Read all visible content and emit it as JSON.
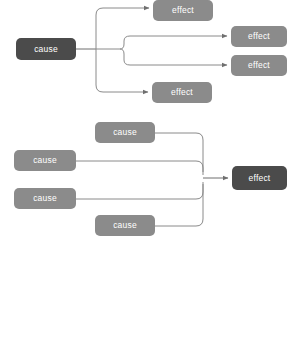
{
  "canvas": {
    "width": 287,
    "height": 345,
    "background": "#ffffff"
  },
  "palette": {
    "dark_box": "#4b4b4b",
    "mid_box": "#8b8b8b",
    "connector": "#7d7d7d",
    "label_text": "#ffffff"
  },
  "diagrams": [
    {
      "id": "one-to-many",
      "name": "one cause many effects",
      "nodes": [
        {
          "id": "d1-cause",
          "label": "cause",
          "role": "cause",
          "style": "dark",
          "x": 16,
          "y": 38,
          "w": 60,
          "h": 22
        },
        {
          "id": "d1-effect-1",
          "label": "effect",
          "role": "effect",
          "style": "mid",
          "x": 153,
          "y": 0,
          "w": 60,
          "h": 21
        },
        {
          "id": "d1-effect-2",
          "label": "effect",
          "role": "effect",
          "style": "mid",
          "x": 231,
          "y": 26,
          "w": 56,
          "h": 21
        },
        {
          "id": "d1-effect-3",
          "label": "effect",
          "role": "effect",
          "style": "mid",
          "x": 231,
          "y": 55,
          "w": 56,
          "h": 21
        },
        {
          "id": "d1-effect-4",
          "label": "effect",
          "role": "effect",
          "style": "mid",
          "x": 152,
          "y": 82,
          "w": 60,
          "h": 21
        }
      ],
      "edges": [
        {
          "from": "d1-cause",
          "to": "d1-effect-1"
        },
        {
          "from": "d1-cause",
          "to": "d1-effect-2"
        },
        {
          "from": "d1-cause",
          "to": "d1-effect-3"
        },
        {
          "from": "d1-cause",
          "to": "d1-effect-4"
        }
      ]
    },
    {
      "id": "many-to-one",
      "name": "many causes one effect",
      "nodes": [
        {
          "id": "d2-cause-1",
          "label": "cause",
          "role": "cause",
          "style": "mid",
          "x": 95,
          "y": 122,
          "w": 60,
          "h": 21
        },
        {
          "id": "d2-cause-2",
          "label": "cause",
          "role": "cause",
          "style": "mid",
          "x": 14,
          "y": 150,
          "w": 62,
          "h": 21
        },
        {
          "id": "d2-cause-3",
          "label": "cause",
          "role": "cause",
          "style": "mid",
          "x": 14,
          "y": 188,
          "w": 62,
          "h": 21
        },
        {
          "id": "d2-cause-4",
          "label": "cause",
          "role": "cause",
          "style": "mid",
          "x": 95,
          "y": 215,
          "w": 60,
          "h": 21
        },
        {
          "id": "d2-effect",
          "label": "effect",
          "role": "effect",
          "style": "dark",
          "x": 232,
          "y": 166,
          "w": 55,
          "h": 24
        }
      ],
      "edges": [
        {
          "from": "d2-cause-1",
          "to": "d2-effect"
        },
        {
          "from": "d2-cause-2",
          "to": "d2-effect"
        },
        {
          "from": "d2-cause-3",
          "to": "d2-effect"
        },
        {
          "from": "d2-cause-4",
          "to": "d2-effect"
        }
      ]
    }
  ]
}
